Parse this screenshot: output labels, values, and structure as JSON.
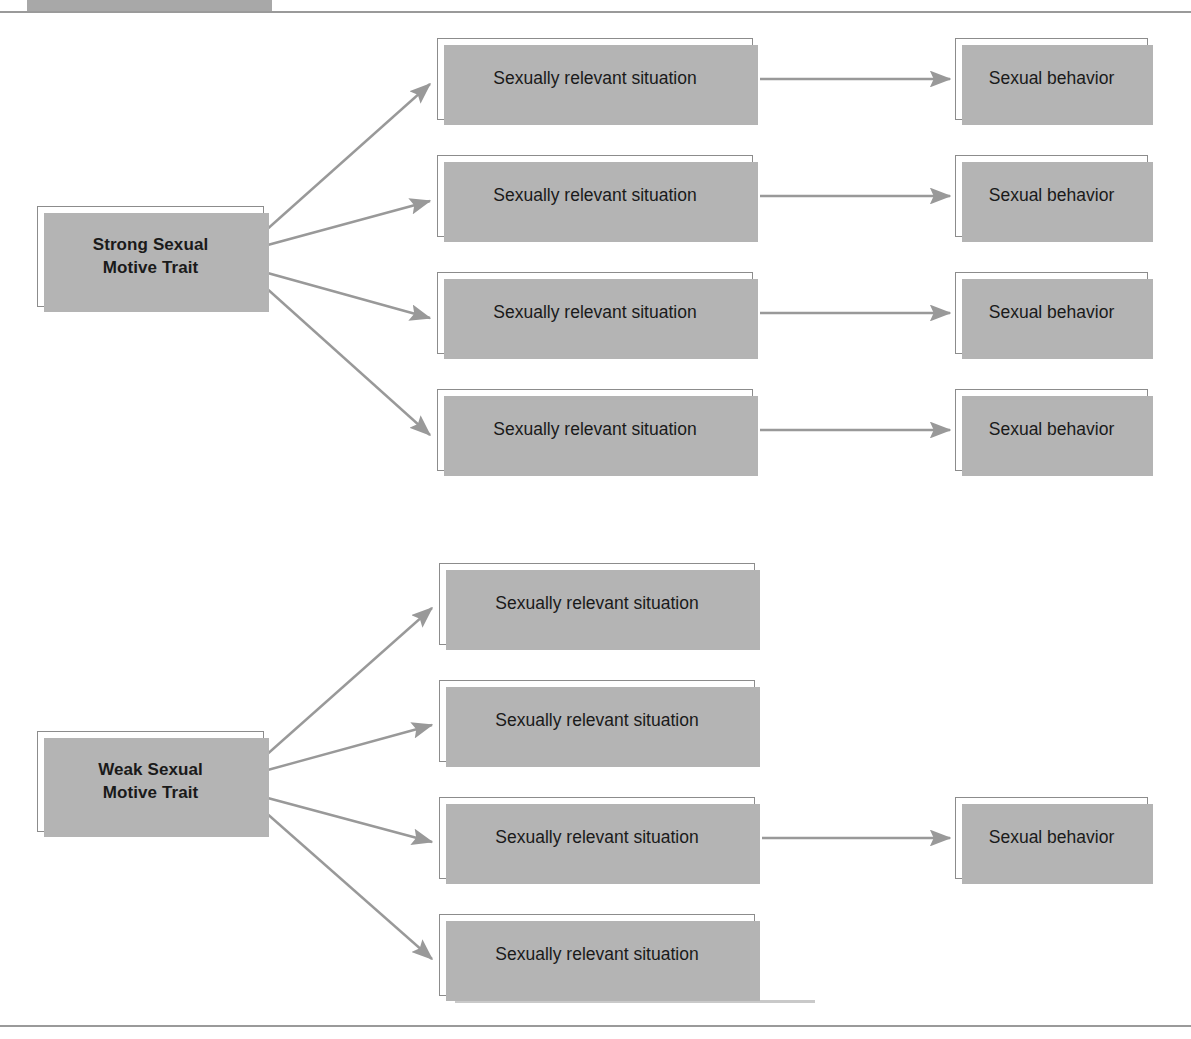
{
  "figure": {
    "title_strip": "",
    "header_caption": "",
    "background_color": "#ffffff",
    "box_border_color": "#8c8c8c",
    "box_fill_color": "#ffffff",
    "box_shadow_color": "#b4b4b4",
    "arrow_color": "#999999",
    "text_color": "#1a1a1a",
    "rule_color": "#9a9a9a",
    "tab_color": "#a8a8a8"
  },
  "strong_branch": {
    "trait_label": "Strong Sexual\nMotive Trait",
    "trait_line_1": "Strong Sexual",
    "trait_line_2": "Motive Trait",
    "situations": [
      {
        "label": "Sexually relevant situation",
        "leads_to_behavior": true
      },
      {
        "label": "Sexually relevant situation",
        "leads_to_behavior": true
      },
      {
        "label": "Sexually relevant situation",
        "leads_to_behavior": true
      },
      {
        "label": "Sexually relevant situation",
        "leads_to_behavior": true
      }
    ],
    "behaviors": [
      {
        "label": "Sexual behavior"
      },
      {
        "label": "Sexual behavior"
      },
      {
        "label": "Sexual behavior"
      },
      {
        "label": "Sexual behavior"
      }
    ]
  },
  "weak_branch": {
    "trait_label": "Weak Sexual\nMotive Trait",
    "trait_line_1": "Weak Sexual",
    "trait_line_2": "Motive Trait",
    "situations": [
      {
        "label": "Sexually relevant situation",
        "leads_to_behavior": false
      },
      {
        "label": "Sexually relevant situation",
        "leads_to_behavior": false
      },
      {
        "label": "Sexually relevant situation",
        "leads_to_behavior": true
      },
      {
        "label": "Sexually relevant situation",
        "leads_to_behavior": false
      }
    ],
    "behaviors": [
      {
        "label": "Sexual behavior"
      }
    ]
  }
}
